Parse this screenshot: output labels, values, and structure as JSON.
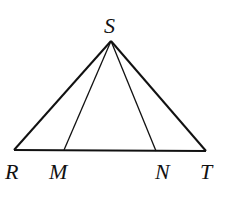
{
  "diagram": {
    "type": "triangle",
    "stroke_color": "#111111",
    "background": "#ffffff",
    "points": {
      "S": {
        "label": "S",
        "x": 111,
        "y": 41
      },
      "R": {
        "label": "R",
        "x": 14,
        "y": 150
      },
      "M": {
        "label": "M",
        "x": 64,
        "y": 150
      },
      "N": {
        "label": "N",
        "x": 156,
        "y": 151
      },
      "T": {
        "label": "T",
        "x": 206,
        "y": 151
      }
    },
    "segments": [
      {
        "from": "S",
        "to": "R"
      },
      {
        "from": "S",
        "to": "T"
      },
      {
        "from": "R",
        "to": "T"
      },
      {
        "from": "S",
        "to": "M"
      },
      {
        "from": "S",
        "to": "N"
      }
    ],
    "labels": {
      "S": "S",
      "R": "R",
      "M": "M",
      "N": "N",
      "T": "T"
    }
  }
}
